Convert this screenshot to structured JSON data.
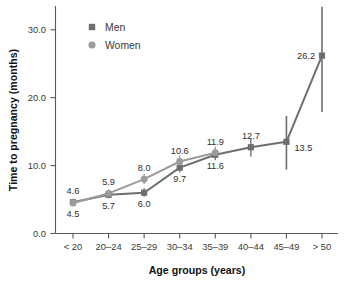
{
  "chart_data": {
    "type": "line",
    "title": "",
    "xlabel": "Age groups (years)",
    "ylabel": "Time to pregnancy (months)",
    "categories": [
      "< 20",
      "20–24",
      "25–29",
      "30–34",
      "35–39",
      "40–44",
      "45–49",
      "> 50"
    ],
    "ylim": [
      0.0,
      33.5
    ],
    "ytick_labels": [
      "0.0",
      "10.0",
      "20.0",
      "30.0"
    ],
    "ytick_values": [
      0.0,
      10.0,
      20.0,
      30.0
    ],
    "grid": false,
    "legend_position": "top-left",
    "series": [
      {
        "name": "Men",
        "marker": "square",
        "color": "#6e6e6e",
        "values": [
          4.6,
          5.7,
          6.0,
          9.7,
          11.6,
          12.7,
          13.5,
          26.2
        ],
        "labels": [
          "4.6",
          "5.7",
          "6.0",
          "9.7",
          "11.6",
          "12.7",
          "13.5",
          "26.2"
        ],
        "label_position": [
          "above",
          "below",
          "below",
          "below",
          "below",
          "above",
          "right",
          "left"
        ],
        "error_low": [
          4.1,
          5.2,
          5.4,
          9.0,
          10.8,
          11.3,
          9.4,
          17.9
        ],
        "error_high": [
          5.1,
          6.3,
          6.7,
          10.4,
          12.4,
          14.0,
          17.3,
          33.4
        ]
      },
      {
        "name": "Women",
        "marker": "circle",
        "color": "#9b9b9b",
        "values": [
          4.5,
          5.9,
          8.0,
          10.6,
          11.9,
          null,
          null,
          null
        ],
        "labels": [
          "4.5",
          "5.9",
          "8.0",
          "10.6",
          "11.9",
          "",
          "",
          ""
        ],
        "label_position": [
          "below",
          "above",
          "above",
          "above",
          "above",
          "",
          "",
          ""
        ],
        "error_low": [
          4.0,
          5.4,
          7.3,
          9.8,
          11.0,
          null,
          null,
          null
        ],
        "error_high": [
          5.0,
          6.5,
          8.8,
          11.5,
          12.8,
          null,
          null,
          null
        ]
      }
    ]
  },
  "legend": {
    "items": [
      {
        "label": "Men",
        "marker": "square",
        "color": "#6e6e6e"
      },
      {
        "label": "Women",
        "marker": "circle",
        "color": "#9b9b9b"
      }
    ]
  },
  "axes": {
    "y_title": "Time to pregnancy (months)",
    "x_title": "Age groups (years)"
  }
}
